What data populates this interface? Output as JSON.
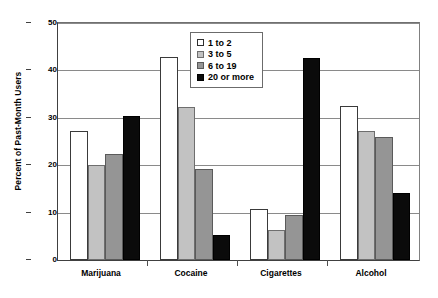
{
  "chart_data": {
    "type": "bar",
    "title": "",
    "xlabel": "",
    "ylabel": "Percent of Past-Month Users",
    "categories": [
      "Marijuana",
      "Cocaine",
      "Cigarettes",
      "Alcohol"
    ],
    "series": [
      {
        "name": "1 to 2",
        "color": "#ffffff",
        "values": [
          27.2,
          42.9,
          10.7,
          32.4
        ]
      },
      {
        "name": "3 to 5",
        "color": "#c2c2c2",
        "values": [
          20.0,
          32.3,
          6.3,
          27.2
        ]
      },
      {
        "name": "6 to 19",
        "color": "#959595",
        "values": [
          22.3,
          19.3,
          9.6,
          26.0
        ]
      },
      {
        "name": "20 or more",
        "color": "#0b0b0b",
        "values": [
          30.4,
          5.3,
          42.7,
          14.1
        ]
      }
    ],
    "ylim": [
      0,
      50
    ],
    "yticks": [
      0,
      10,
      20,
      30,
      40,
      50
    ],
    "ytick_labels": [
      "0",
      "10",
      "20",
      "30",
      "40",
      "50"
    ],
    "grid": true,
    "legend_position": "upper center"
  },
  "axis": {
    "y_title": "Percent of Past-Month Users",
    "tick_0": "0",
    "tick_10": "10",
    "tick_20": "20",
    "tick_30": "30",
    "tick_40": "40",
    "tick_50": "50"
  },
  "categories": {
    "c0": "Marijuana",
    "c1": "Cocaine",
    "c2": "Cigarettes",
    "c3": "Alcohol"
  },
  "legend": {
    "items": [
      {
        "label": "1 to 2"
      },
      {
        "label": "3 to 5"
      },
      {
        "label": "6 to 19"
      },
      {
        "label": "20 or more"
      }
    ]
  }
}
